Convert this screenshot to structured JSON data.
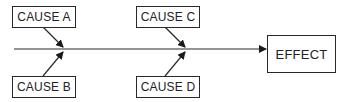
{
  "diagram": {
    "type": "fishbone",
    "causes": [
      {
        "label": "CAUSE A"
      },
      {
        "label": "CAUSE B"
      },
      {
        "label": "CAUSE C"
      },
      {
        "label": "CAUSE D"
      }
    ],
    "effect": {
      "label": "EFFECT"
    },
    "colors": {
      "line": "#2a2a2a",
      "background": "#ffffff"
    }
  }
}
